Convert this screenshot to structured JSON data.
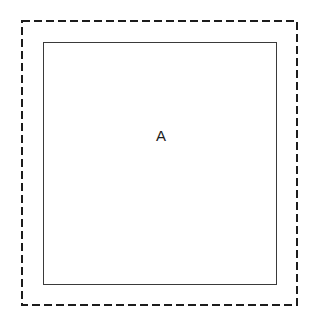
{
  "diagram": {
    "background_color": "#ffffff",
    "canvas": {
      "width": 319,
      "height": 325
    },
    "boundary": {
      "name": "dashed-outer-boundary",
      "style": "dashed",
      "stroke_color": "#1c1c1c",
      "stroke_width": 2,
      "dash_length": 8,
      "gap_length": 4,
      "x": 21,
      "y": 20,
      "width": 277,
      "height": 286
    },
    "region": {
      "name": "region-a",
      "label": "A",
      "style": "solid",
      "stroke_color": "#3a3a3a",
      "stroke_width": 1.5,
      "fill_color": "#ffffff",
      "x": 43,
      "y": 42,
      "width": 234,
      "height": 243,
      "label_offset_top": 85
    }
  }
}
